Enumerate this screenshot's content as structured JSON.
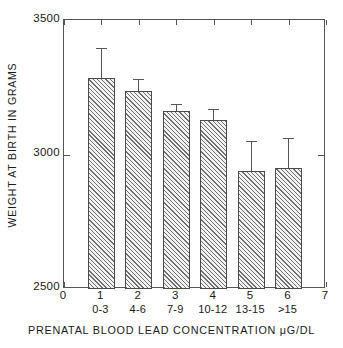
{
  "chart_data": {
    "type": "bar",
    "title": "",
    "xlabel": "PRENATAL BLOOD LEAD CONCENTRATION μG/DL",
    "ylabel": "WEIGHT AT BIRTH IN GRAMS",
    "categories": [
      "0-3",
      "4-6",
      "7-9",
      "10-12",
      "13-15",
      ">15"
    ],
    "x": [
      1,
      2,
      3,
      4,
      5,
      6
    ],
    "values": [
      3285,
      3237,
      3163,
      3129,
      2940,
      2951
    ],
    "errors_upper": [
      3396,
      3282,
      3189,
      3170,
      3051,
      3062
    ],
    "error_type": "upper-whisker-only",
    "ylim": [
      2500,
      3500
    ],
    "xlim": [
      0,
      7
    ],
    "yticks": [
      2500,
      3000,
      3500
    ],
    "ytick_labels": [
      "2500",
      "3000",
      "3500"
    ],
    "xticks": [
      0,
      1,
      2,
      3,
      4,
      5,
      6,
      7
    ],
    "xtick_labels": [
      "0",
      "1",
      "2",
      "3",
      "4",
      "5",
      "6",
      "7"
    ],
    "grid": false,
    "legend": null,
    "bar_fill": "hatched-diagonal",
    "colors": {
      "axis": "#555555",
      "bar_edge": "#4a4a4a",
      "bar_hatch": "#6f6f6f",
      "bar_background": "#f2f2f2",
      "text": "#1a1a1a",
      "page_background": "#ffffff"
    }
  }
}
